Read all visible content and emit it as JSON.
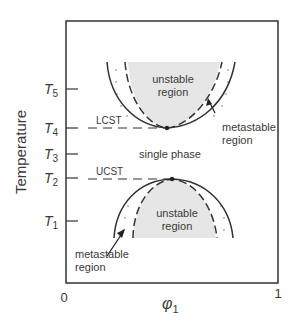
{
  "diagram": {
    "type": "phase-diagram",
    "y_axis_label": "Temperature",
    "x_axis_label_symbol": "φ",
    "x_axis_label_sub": "1",
    "x_ticks": [
      "0",
      "1"
    ],
    "temperature_ticks": [
      {
        "name": "T",
        "sub": "5"
      },
      {
        "name": "T",
        "sub": "4"
      },
      {
        "name": "T",
        "sub": "3"
      },
      {
        "name": "T",
        "sub": "2"
      },
      {
        "name": "T",
        "sub": "1"
      }
    ],
    "critical_labels": {
      "lcst": "LCST",
      "ucst": "UCST"
    },
    "regions": {
      "upper_unstable_line1": "unstable",
      "upper_unstable_line2": "region",
      "upper_metastable_line1": "metastable",
      "upper_metastable_line2": "region",
      "single_phase": "single phase",
      "lower_unstable_line1": "unstable",
      "lower_unstable_line2": "region",
      "lower_metastable_line1": "metastable",
      "lower_metastable_line2": "region"
    },
    "colors": {
      "line": "#333333",
      "unstable_fill": "#e6e6e6",
      "text": "#3a3a3a"
    }
  }
}
